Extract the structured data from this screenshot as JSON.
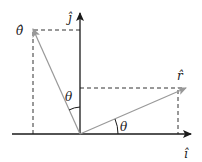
{
  "diagram": {
    "labels": {
      "j_hat": "ĵ",
      "i_hat": "î",
      "r_hat": "r̂",
      "theta_hat": "θ̂",
      "theta_upper": "θ",
      "theta_lower": "θ"
    },
    "colors": {
      "axis": "#1a1a1a",
      "vector": "#999999",
      "dashed": "#333333",
      "text": "#222222"
    }
  }
}
